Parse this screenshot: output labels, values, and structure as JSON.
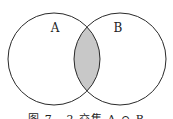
{
  "diagram": {
    "type": "venn",
    "sets": [
      {
        "label": "A",
        "cx": 54,
        "cy": 59,
        "r": 46
      },
      {
        "label": "B",
        "cx": 120,
        "cy": 59,
        "r": 46
      }
    ],
    "highlight": "A ∩ B",
    "colors": {
      "stroke": "#2a2a2a",
      "fill": "#c8c8c8",
      "background": "#ffffff"
    }
  },
  "labels": {
    "a": "A",
    "b": "B"
  },
  "caption": "图 7 - 2   交集 A ∩ B"
}
